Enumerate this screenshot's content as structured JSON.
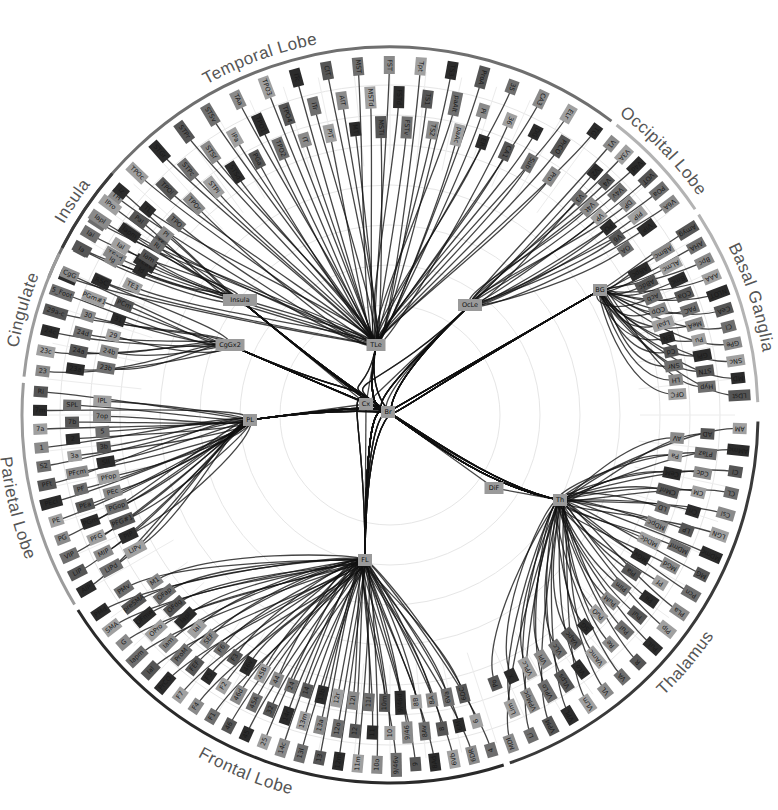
{
  "diagram": {
    "center": {
      "x": 390,
      "y": 415
    },
    "radius": {
      "lobe_arc": 368,
      "outer_nodes": 350,
      "mid_nodes": 318,
      "inner_nodes": 288
    },
    "root": {
      "label": "Br",
      "x": 388,
      "y": 412
    },
    "root_children": [
      {
        "id": "Cx",
        "label": "Cx",
        "x": 366,
        "y": 404
      },
      {
        "id": "DiF",
        "label": "DiF",
        "x": 494,
        "y": 488
      }
    ],
    "hubs": [
      {
        "id": "TLe",
        "label": "TLe",
        "x": 376,
        "y": 345,
        "parent": "Cx"
      },
      {
        "id": "OLe",
        "label": "OcLe",
        "x": 470,
        "y": 305,
        "parent": "Cx"
      },
      {
        "id": "BG",
        "label": "BG",
        "x": 600,
        "y": 290,
        "parent": "Br"
      },
      {
        "id": "Th",
        "label": "Th",
        "x": 560,
        "y": 500,
        "parent": "DiF"
      },
      {
        "id": "FL",
        "label": "FL",
        "x": 365,
        "y": 560,
        "parent": "Cx"
      },
      {
        "id": "PL",
        "label": "PL",
        "x": 250,
        "y": 420,
        "parent": "Cx"
      },
      {
        "id": "CgG",
        "label": "CgGx2",
        "x": 230,
        "y": 345,
        "parent": "Cx"
      },
      {
        "id": "Ins",
        "label": "Insula",
        "x": 240,
        "y": 300,
        "parent": "Cx"
      }
    ],
    "lobes": [
      {
        "id": "temporal",
        "label": "Temporal Lobe",
        "start": -68,
        "end": 37,
        "color": "#6f6f6f",
        "label_angle": -20,
        "hub": "TLe",
        "nodes": [
          "TE1",
          "TE2",
          "TE3",
          "TEa",
          "TEad",
          "TEav",
          "TEm",
          "TEO",
          "TF",
          "TH",
          "TL",
          "TPO",
          "TPOc",
          "TPOi",
          "TPOr",
          "STGr",
          "STPc",
          "STPi",
          "STPr",
          "STSf",
          "STSd",
          "STSv",
          "IPa",
          "PGa",
          "TAa",
          "TPO1",
          "TPO2",
          "TPO3",
          "TPO4",
          "IT",
          "ITc",
          "ITr",
          "PIT",
          "CIT",
          "AIT",
          "MT",
          "MST",
          "MSTd",
          "MSTl",
          "FST",
          "FSTd",
          "FSTv",
          "Tpt",
          "TS1",
          "TS2",
          "TS3",
          "paAlt",
          "paAc",
          "ProA",
          "Pi",
          "ER",
          "35",
          "36",
          "CA1",
          "CA3",
          "DG",
          "Sub",
          "ELr",
          "PrCO",
          "Pro",
          "TG"
        ]
      },
      {
        "id": "occipital",
        "label": "Occipital Lobe",
        "start": 38,
        "end": 56,
        "color": "#b3b3b3",
        "label_angle": 46,
        "hub": "OLe",
        "nodes": [
          "V1",
          "V2",
          "V3",
          "V3A",
          "V4",
          "V4t",
          "V4d",
          "V4v",
          "VP",
          "VOT",
          "DP",
          "PO",
          "POa",
          "PIP",
          "V6",
          "V6A",
          "VIP",
          "OA"
        ]
      },
      {
        "id": "basal",
        "label": "Basal Ganglia",
        "start": 57,
        "end": 88,
        "color": "#b3b3b3",
        "label_angle": 72,
        "hub": "BG",
        "nodes": [
          "Amyg",
          "ABmc",
          "ABpc",
          "AHA",
          "ALmc",
          "ABdc",
          "Bpc",
          "Bmc",
          "Acb",
          "AAA",
          "COa",
          "COp",
          "NLOT",
          "PAC",
          "Lpal",
          "CeA",
          "MeA",
          "EN",
          "Cl",
          "Pu",
          "Cd",
          "GPe",
          "GPi",
          "SNr",
          "SNc",
          "STN",
          "LH",
          "MD",
          "Hyp",
          "OFC",
          "LDst"
        ]
      },
      {
        "id": "thalamus",
        "label": "Thalamus",
        "start": 91,
        "end": 161,
        "color": "#3a3a3a",
        "label_angle": 130,
        "hub": "Th",
        "nodes": [
          "AM",
          "AD",
          "AV",
          "AMmc",
          "PTaz",
          "Pa",
          "Cl",
          "Cdc",
          "CeM",
          "CL",
          "CM",
          "CMnf",
          "Csl",
          "Cn",
          "LD",
          "LGN",
          "LP",
          "MDpc",
          "MDmc",
          "MDmf",
          "MDdc",
          "MG",
          "MGd",
          "MGv",
          "Pcn",
          "Pf",
          "Pla",
          "PLa",
          "Pli",
          "Plm",
          "Plp",
          "Pul",
          "PuM",
          "PuL",
          "PuI",
          "PuO",
          "R",
          "Re",
          "SG",
          "VA",
          "VAmc",
          "VApc",
          "VL",
          "VLo",
          "VLc",
          "VLm",
          "VLps",
          "VPI",
          "VPL",
          "VPLo",
          "VPLc",
          "VPM",
          "VPMpc",
          "X",
          "Li",
          "Lim",
          "Po",
          "MDl"
        ]
      },
      {
        "id": "frontal",
        "label": "Frontal Lobe",
        "start": 162,
        "end": 238,
        "color": "#2a2a2a",
        "label_angle": 202,
        "hub": "FL",
        "nodes": [
          "4",
          "6",
          "6DC",
          "6DR",
          "6M",
          "6Va",
          "6Vb",
          "8",
          "8A",
          "8Ad",
          "8Av",
          "8B",
          "9",
          "9/46",
          "9/46d",
          "9/46v",
          "10",
          "10m",
          "10o",
          "11",
          "11l",
          "11m",
          "12",
          "12l",
          "12m",
          "12o",
          "12r",
          "13",
          "13a",
          "13b",
          "13l",
          "13m",
          "14",
          "14c",
          "14r",
          "24",
          "25",
          "32",
          "44",
          "45",
          "45A",
          "45B",
          "46",
          "46d",
          "46v",
          "F1",
          "F2",
          "F3",
          "F4",
          "F5",
          "F6",
          "F7",
          "FEF",
          "SEF",
          "PrCO",
          "ProM",
          "Iai",
          "Ial",
          "Iam",
          "Iapl",
          "Iapm",
          "OPro",
          "OFdg",
          "G",
          "OFmw",
          "OFap",
          "SMA",
          "preSMA",
          "M1",
          "PMd",
          "PMv"
        ]
      },
      {
        "id": "parietal",
        "label": "Parietal Lobe",
        "start": 239,
        "end": 275,
        "color": "#9c9c9c",
        "label_angle": 256,
        "hub": "PL",
        "nodes": [
          "AIP",
          "LIPd",
          "LIPv",
          "LIP",
          "MIP",
          "PIP",
          "VIP",
          "PFG",
          "PFG#1",
          "PG",
          "PGm",
          "PGop",
          "PE",
          "PEa",
          "PEc",
          "PEci",
          "PF",
          "PFop",
          "PFt",
          "PFcm",
          "SII",
          "S2",
          "3a",
          "3b",
          "1",
          "2",
          "5",
          "7a",
          "7b",
          "7op",
          "7m",
          "SPL",
          "IPL",
          "Ri"
        ]
      },
      {
        "id": "cingulate",
        "label": "Cingulate",
        "start": 276,
        "end": 296,
        "color": "#9c9c9c",
        "label_angle": 286,
        "hub": "CgG",
        "nodes": [
          "23",
          "23a",
          "23b",
          "23c",
          "24a",
          "24b",
          "24c",
          "24d",
          "29",
          "29a-c",
          "30",
          "31",
          "5_Foot",
          "PGm#1",
          "PCm",
          "CgG",
          "RSC"
        ]
      },
      {
        "id": "insula",
        "label": "Insula",
        "start": 297,
        "end": 311,
        "color": "#3a3a3a",
        "label_angle": 304,
        "hub": "Ins",
        "nodes": [
          "Ia",
          "Ig",
          "Id",
          "Iai",
          "Ial",
          "Iam",
          "Iapl",
          "Iapm",
          "Ri",
          "IPro",
          "PaI",
          "Pl",
          "Iz"
        ]
      }
    ]
  }
}
